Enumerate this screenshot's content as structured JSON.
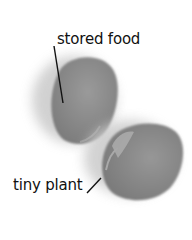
{
  "diagram": {
    "labels": {
      "top": "stored food",
      "bottom": "tiny plant"
    },
    "colors": {
      "seed": "#8a8a8a",
      "seed_dark": "#6f6f6f",
      "shadow": "#cfcfcf",
      "leader_line": "#111111"
    }
  }
}
